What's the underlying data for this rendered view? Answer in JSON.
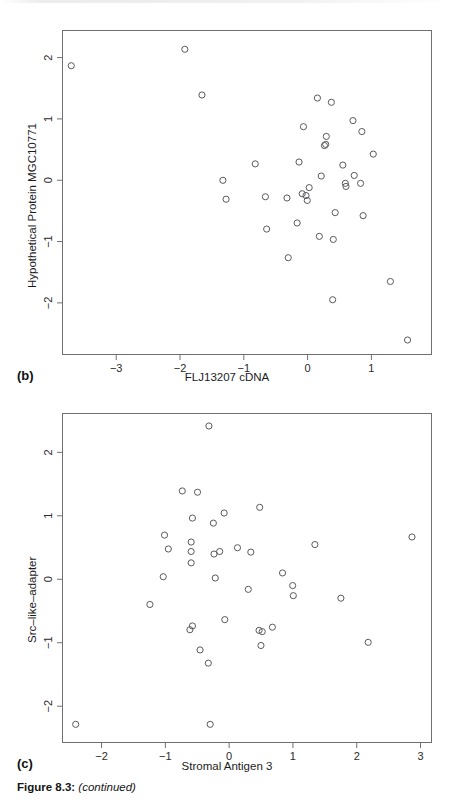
{
  "figure": {
    "caption_prefix": "Figure 8.3:",
    "caption_rest": "(continued)",
    "caption_open": "(",
    "caption_close": ")",
    "ink_color": "#58595c",
    "frame_color": "#6f7073"
  },
  "panels": [
    {
      "label": "(b)",
      "xlabel": "FLJ13207 cDNA",
      "ylabel": "Hypothetical Protein MGC10771"
    },
    {
      "label": "(c)",
      "xlabel": "Stromal Antigen 3",
      "ylabel": "Src–like–adapter"
    }
  ],
  "chart_data": [
    {
      "type": "scatter",
      "panel": "(b)",
      "title": "",
      "xlabel": "FLJ13207 cDNA",
      "ylabel": "Hypothetical Protein MGC10771",
      "xticks": [
        -3,
        -2,
        -1,
        0,
        1
      ],
      "yticks": [
        -2,
        -1,
        0,
        1,
        2
      ],
      "xticklabels": [
        "−3",
        "−2",
        "−1",
        "0",
        "1"
      ],
      "yticklabels": [
        "−2",
        "−1",
        "0",
        "1",
        "2"
      ],
      "xlim": [
        -3.85,
        1.95
      ],
      "ylim": [
        -2.85,
        2.45
      ],
      "grid": false,
      "legend": false,
      "marker": "open-circle",
      "points": [
        {
          "x": -3.72,
          "y": 1.88
        },
        {
          "x": -1.93,
          "y": 2.15
        },
        {
          "x": -1.66,
          "y": 1.4
        },
        {
          "x": -1.33,
          "y": 0.0
        },
        {
          "x": -1.28,
          "y": -0.31
        },
        {
          "x": -0.82,
          "y": 0.27
        },
        {
          "x": -0.66,
          "y": -0.27
        },
        {
          "x": -0.64,
          "y": -0.8
        },
        {
          "x": -0.32,
          "y": -0.29
        },
        {
          "x": -0.3,
          "y": -1.27
        },
        {
          "x": -0.16,
          "y": -0.7
        },
        {
          "x": -0.13,
          "y": 0.3
        },
        {
          "x": -0.08,
          "y": -0.22
        },
        {
          "x": -0.02,
          "y": -0.25
        },
        {
          "x": 0.0,
          "y": -0.33
        },
        {
          "x": 0.03,
          "y": -0.12
        },
        {
          "x": -0.06,
          "y": 0.88
        },
        {
          "x": 0.16,
          "y": 1.35
        },
        {
          "x": 0.19,
          "y": -0.92
        },
        {
          "x": 0.22,
          "y": 0.07
        },
        {
          "x": 0.27,
          "y": 0.57
        },
        {
          "x": 0.29,
          "y": 0.59
        },
        {
          "x": 0.3,
          "y": 0.72
        },
        {
          "x": 0.38,
          "y": 1.28
        },
        {
          "x": 0.4,
          "y": -1.96
        },
        {
          "x": 0.41,
          "y": -0.97
        },
        {
          "x": 0.44,
          "y": -0.53
        },
        {
          "x": 0.56,
          "y": 0.25
        },
        {
          "x": 0.6,
          "y": -0.05
        },
        {
          "x": 0.61,
          "y": -0.1
        },
        {
          "x": 0.72,
          "y": 0.98
        },
        {
          "x": 0.74,
          "y": 0.08
        },
        {
          "x": 0.84,
          "y": -0.05
        },
        {
          "x": 0.86,
          "y": 0.8
        },
        {
          "x": 0.88,
          "y": -0.58
        },
        {
          "x": 1.04,
          "y": 0.43
        },
        {
          "x": 1.31,
          "y": -1.66
        },
        {
          "x": 1.58,
          "y": -2.62
        }
      ]
    },
    {
      "type": "scatter",
      "panel": "(c)",
      "title": "",
      "xlabel": "Stromal Antigen 3",
      "ylabel": "Src–like–adapter",
      "xticks": [
        -2,
        -1,
        0,
        1,
        2,
        3
      ],
      "yticks": [
        -2,
        -1,
        0,
        1,
        2
      ],
      "xticklabels": [
        "−2",
        "−1",
        "0",
        "1",
        "2",
        "3"
      ],
      "yticklabels": [
        "−2",
        "−1",
        "0",
        "1",
        "2"
      ],
      "xlim": [
        -2.62,
        3.18
      ],
      "ylim": [
        -2.58,
        2.62
      ],
      "grid": false,
      "legend": false,
      "marker": "open-circle",
      "points": [
        {
          "x": -2.42,
          "y": -2.3
        },
        {
          "x": -1.25,
          "y": -0.4
        },
        {
          "x": -1.02,
          "y": 0.7
        },
        {
          "x": -1.04,
          "y": 0.04
        },
        {
          "x": -0.96,
          "y": 0.48
        },
        {
          "x": -0.74,
          "y": 1.4
        },
        {
          "x": -0.58,
          "y": 0.97
        },
        {
          "x": -0.6,
          "y": 0.59
        },
        {
          "x": -0.6,
          "y": 0.44
        },
        {
          "x": -0.6,
          "y": 0.26
        },
        {
          "x": -0.62,
          "y": -0.8
        },
        {
          "x": -0.58,
          "y": -0.74
        },
        {
          "x": -0.5,
          "y": 1.38
        },
        {
          "x": -0.46,
          "y": -1.12
        },
        {
          "x": -0.33,
          "y": -1.33
        },
        {
          "x": -0.32,
          "y": 2.43
        },
        {
          "x": -0.3,
          "y": -2.3
        },
        {
          "x": -0.25,
          "y": 0.89
        },
        {
          "x": -0.24,
          "y": 0.4
        },
        {
          "x": -0.22,
          "y": 0.02
        },
        {
          "x": -0.15,
          "y": 0.44
        },
        {
          "x": -0.08,
          "y": 1.05
        },
        {
          "x": -0.07,
          "y": -0.64
        },
        {
          "x": 0.13,
          "y": 0.5
        },
        {
          "x": 0.3,
          "y": -0.16
        },
        {
          "x": 0.34,
          "y": 0.43
        },
        {
          "x": 0.48,
          "y": 1.14
        },
        {
          "x": 0.47,
          "y": -0.81
        },
        {
          "x": 0.52,
          "y": -0.83
        },
        {
          "x": 0.5,
          "y": -1.05
        },
        {
          "x": 0.68,
          "y": -0.76
        },
        {
          "x": 0.84,
          "y": 0.1
        },
        {
          "x": 1.0,
          "y": -0.1
        },
        {
          "x": 1.01,
          "y": -0.26
        },
        {
          "x": 1.35,
          "y": 0.55
        },
        {
          "x": 1.76,
          "y": -0.3
        },
        {
          "x": 2.19,
          "y": -1.0
        },
        {
          "x": 2.88,
          "y": 0.67
        }
      ]
    }
  ]
}
